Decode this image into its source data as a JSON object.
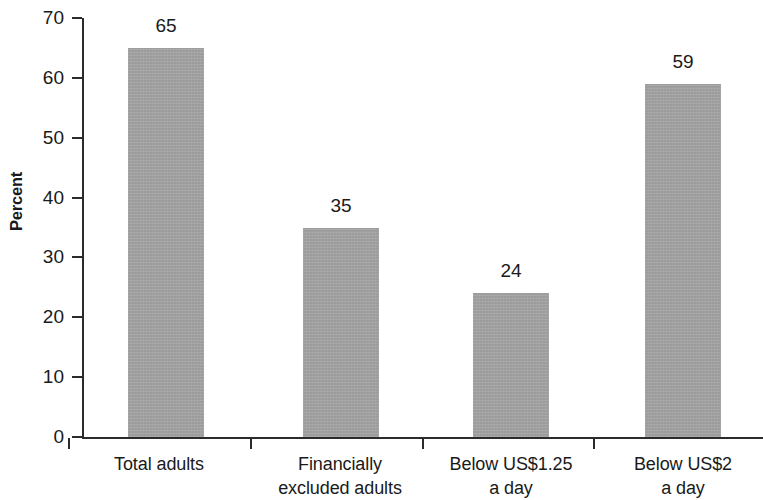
{
  "chart_data": {
    "type": "bar",
    "title": "",
    "subtitle": "",
    "xlabel": "",
    "ylabel": "Percent",
    "ylim": [
      0,
      70
    ],
    "ytick_step": 10,
    "grid": false,
    "legend": null,
    "categories": [
      "Total adults",
      "Financially excluded adults",
      "Below US$1.25 a day",
      "Below US$2 a day"
    ],
    "category_lines": [
      [
        "Total adults"
      ],
      [
        "Financially",
        "excluded adults"
      ],
      [
        "Below US$1.25",
        "a day"
      ],
      [
        "Below US$2",
        "a day"
      ]
    ],
    "values": [
      65,
      35,
      24,
      59
    ],
    "value_labels": [
      "65",
      "35",
      "24",
      "59"
    ],
    "ytick_labels": [
      "70",
      "60",
      "50",
      "40",
      "30",
      "20",
      "10",
      "0"
    ],
    "ytick_values": [
      70,
      60,
      50,
      40,
      30,
      20,
      10,
      0
    ],
    "bar_color": "#a3a3a3",
    "axis_color": "#2b2b2b",
    "text_color": "#1a1a1a"
  }
}
